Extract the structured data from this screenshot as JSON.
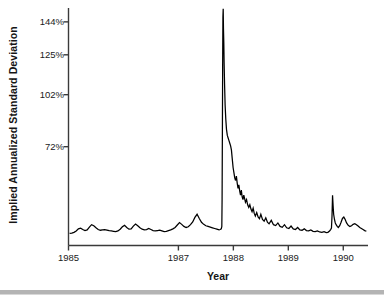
{
  "chart_data": {
    "type": "line",
    "title": "",
    "xlabel": "Year",
    "ylabel": "Implied Annualized Standard Deviation",
    "xlim": [
      1985.0,
      1990.45
    ],
    "ylim": [
      15,
      152
    ],
    "grid": false,
    "legend": null,
    "line_color": "#000000",
    "axis_color": "#3a3a3a",
    "y_ticks": [
      {
        "value": 144,
        "label": "144%"
      },
      {
        "value": 125,
        "label": "125%"
      },
      {
        "value": 102,
        "label": "102%"
      },
      {
        "value": 72,
        "label": "72%"
      }
    ],
    "x_ticks": [
      {
        "value": 1985,
        "label": "1985"
      },
      {
        "value": 1987,
        "label": "1987"
      },
      {
        "value": 1988,
        "label": "1988"
      },
      {
        "value": 1989,
        "label": "1989"
      },
      {
        "value": 1990,
        "label": "1990"
      }
    ],
    "annotations": [
      {
        "text": "October 1987 crash volatility spike",
        "x": 1987.8,
        "y": 150
      }
    ],
    "series": [
      {
        "name": "Implied Annualized Standard Deviation",
        "x": [
          1985.02,
          1985.06,
          1985.1,
          1985.14,
          1985.18,
          1985.22,
          1985.26,
          1985.3,
          1985.34,
          1985.38,
          1985.42,
          1985.46,
          1985.5,
          1985.54,
          1985.58,
          1985.62,
          1985.66,
          1985.7,
          1985.74,
          1985.78,
          1985.82,
          1985.86,
          1985.9,
          1985.94,
          1985.98,
          1986.02,
          1986.06,
          1986.1,
          1986.14,
          1986.18,
          1986.22,
          1986.26,
          1986.3,
          1986.34,
          1986.38,
          1986.42,
          1986.46,
          1986.5,
          1986.54,
          1986.58,
          1986.62,
          1986.66,
          1986.7,
          1986.74,
          1986.78,
          1986.82,
          1986.86,
          1986.9,
          1986.94,
          1986.98,
          1987.02,
          1987.06,
          1987.1,
          1987.14,
          1987.18,
          1987.22,
          1987.26,
          1987.3,
          1987.34,
          1987.38,
          1987.42,
          1987.46,
          1987.5,
          1987.54,
          1987.58,
          1987.62,
          1987.66,
          1987.7,
          1987.74,
          1987.76,
          1987.78,
          1987.79,
          1987.795,
          1987.8,
          1987.805,
          1987.81,
          1987.815,
          1987.82,
          1987.826,
          1987.832,
          1987.84,
          1987.85,
          1987.862,
          1987.875,
          1987.89,
          1987.905,
          1987.92,
          1987.935,
          1987.95,
          1987.965,
          1987.98,
          1987.995,
          1988.01,
          1988.025,
          1988.04,
          1988.055,
          1988.07,
          1988.085,
          1988.1,
          1988.115,
          1988.13,
          1988.145,
          1988.16,
          1988.175,
          1988.19,
          1988.205,
          1988.22,
          1988.24,
          1988.26,
          1988.28,
          1988.3,
          1988.32,
          1988.34,
          1988.36,
          1988.38,
          1988.4,
          1988.425,
          1988.45,
          1988.475,
          1988.5,
          1988.53,
          1988.56,
          1988.59,
          1988.62,
          1988.65,
          1988.69,
          1988.73,
          1988.77,
          1988.81,
          1988.85,
          1988.89,
          1988.93,
          1988.97,
          1989.01,
          1989.05,
          1989.09,
          1989.13,
          1989.17,
          1989.21,
          1989.25,
          1989.29,
          1989.33,
          1989.37,
          1989.41,
          1989.45,
          1989.49,
          1989.53,
          1989.57,
          1989.61,
          1989.65,
          1989.69,
          1989.72,
          1989.75,
          1989.77,
          1989.785,
          1989.795,
          1989.805,
          1989.815,
          1989.825,
          1989.84,
          1989.855,
          1989.87,
          1989.89,
          1989.91,
          1989.935,
          1989.96,
          1989.985,
          1990.01,
          1990.035,
          1990.06,
          1990.09,
          1990.12,
          1990.15,
          1990.18,
          1990.21,
          1990.24,
          1990.27,
          1990.3,
          1990.33,
          1990.36,
          1990.39,
          1990.42
        ],
        "y": [
          22.0,
          22.2,
          22.6,
          23.4,
          24.6,
          25.0,
          24.2,
          23.6,
          24.0,
          25.6,
          27.0,
          26.4,
          25.2,
          24.2,
          23.8,
          24.0,
          24.2,
          23.9,
          23.6,
          23.4,
          23.2,
          23.0,
          23.4,
          24.4,
          25.8,
          26.6,
          25.4,
          24.4,
          24.6,
          26.2,
          27.4,
          26.4,
          25.2,
          24.4,
          24.0,
          24.2,
          24.8,
          24.2,
          23.6,
          23.4,
          23.6,
          23.8,
          23.4,
          23.0,
          23.2,
          23.6,
          24.0,
          24.6,
          25.4,
          26.8,
          28.2,
          27.2,
          26.0,
          25.4,
          25.8,
          27.0,
          28.6,
          31.2,
          33.0,
          30.6,
          28.4,
          27.2,
          26.4,
          26.0,
          25.6,
          25.2,
          24.8,
          24.4,
          24.0,
          24.2,
          24.6,
          26.0,
          42.0,
          78.0,
          118.0,
          147.0,
          151.5,
          140.0,
          132.0,
          120.0,
          108.0,
          96.0,
          88.0,
          82.0,
          78.5,
          77.0,
          75.5,
          74.0,
          72.5,
          70.0,
          65.0,
          60.0,
          57.0,
          54.0,
          52.5,
          55.0,
          51.0,
          48.0,
          50.0,
          46.5,
          44.0,
          47.0,
          43.0,
          41.5,
          44.0,
          42.0,
          40.0,
          41.5,
          38.5,
          37.0,
          38.5,
          36.0,
          34.5,
          36.5,
          33.5,
          32.0,
          34.0,
          31.5,
          30.5,
          33.0,
          30.0,
          29.0,
          31.0,
          28.5,
          27.5,
          29.5,
          27.0,
          26.5,
          28.0,
          26.0,
          25.5,
          27.0,
          25.2,
          24.8,
          26.2,
          24.6,
          24.2,
          25.4,
          24.0,
          23.8,
          24.6,
          23.6,
          23.4,
          24.0,
          23.2,
          23.0,
          23.4,
          22.8,
          22.6,
          23.0,
          22.4,
          22.6,
          23.4,
          24.2,
          25.0,
          32.0,
          44.0,
          38.0,
          33.0,
          30.0,
          28.0,
          27.0,
          26.0,
          25.4,
          26.4,
          28.4,
          30.6,
          31.4,
          30.0,
          28.0,
          26.6,
          26.0,
          26.4,
          27.2,
          27.6,
          27.0,
          26.2,
          25.4,
          24.8,
          24.2,
          23.6,
          23.2
        ]
      }
    ]
  },
  "bottom_rule": {
    "color": "#b4b4b4"
  }
}
